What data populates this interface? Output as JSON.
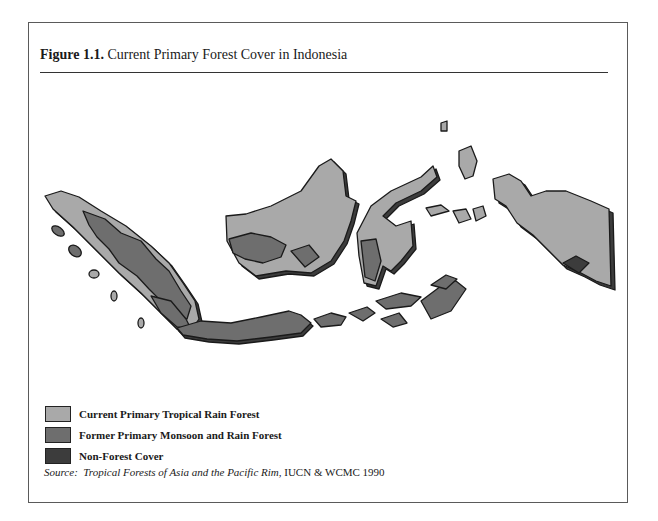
{
  "figure": {
    "label": "Figure 1.1.",
    "title": "Current Primary Forest Cover in Indonesia"
  },
  "legend": {
    "items": [
      {
        "label": "Current Primary Tropical Rain Forest",
        "color": "#a9a9a9"
      },
      {
        "label": "Former Primary Monsoon and Rain Forest",
        "color": "#6e6e6e"
      },
      {
        "label": "Non-Forest Cover",
        "color": "#3c3c3c"
      }
    ]
  },
  "source": {
    "prefix": "Source:",
    "work": "Tropical Forests of Asia and the Pacific Rim,",
    "publisher": "IUCN & WCMC 1990"
  },
  "map": {
    "regions": [
      "Sumatra",
      "Kalimantan (Borneo)",
      "Sulawesi",
      "Java",
      "Lesser Sunda Islands",
      "Maluku",
      "Irian Jaya"
    ],
    "colors": {
      "rain_forest": "#a9a9a9",
      "monsoon_forest": "#6e6e6e",
      "non_forest": "#3c3c3c",
      "outline": "#1a1a1a"
    }
  }
}
